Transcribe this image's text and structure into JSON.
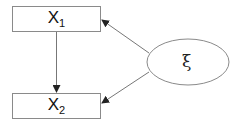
{
  "diagram": {
    "nodes": [
      {
        "id": "x1",
        "shape": "rectangle",
        "label": "X",
        "subscript": "1"
      },
      {
        "id": "x2",
        "shape": "rectangle",
        "label": "X",
        "subscript": "2"
      },
      {
        "id": "xi",
        "shape": "ellipse",
        "label": "ξ"
      }
    ],
    "edges": [
      {
        "from": "x1",
        "to": "x2"
      },
      {
        "from": "xi",
        "to": "x1"
      },
      {
        "from": "xi",
        "to": "x2"
      }
    ],
    "colors": {
      "stroke": "#8a8a8a",
      "arrow": "#222222",
      "text": "#111111"
    }
  }
}
